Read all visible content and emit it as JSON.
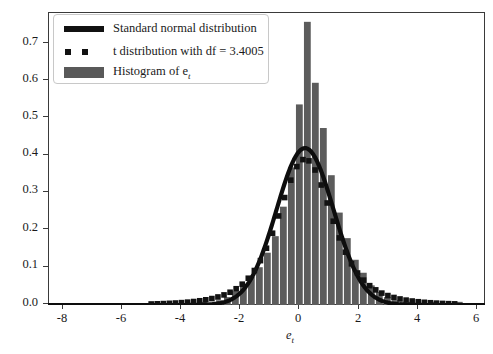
{
  "figure": {
    "background_color": "#ffffff",
    "frame_color": "#3a3a3a"
  },
  "legend": {
    "position": "upper-left",
    "entries": [
      {
        "label": "Standard normal distribution",
        "marker": "line",
        "color": "#111111"
      },
      {
        "label": "t distribution with df = 3.4005",
        "marker": "squares",
        "color": "#111111"
      },
      {
        "label": "Histogram of e",
        "label_sub": "t",
        "marker": "patch",
        "color": "#595959"
      }
    ]
  },
  "axes": {
    "xlabel": "e",
    "xlabel_sub": "t",
    "ylabel": "",
    "xticks": [
      "-8",
      "-6",
      "-4",
      "-2",
      "0",
      "2",
      "4",
      "6"
    ],
    "yticks": [
      "0.0",
      "0.1",
      "0.2",
      "0.3",
      "0.4",
      "0.5",
      "0.6",
      "0.7"
    ]
  },
  "chart_data": {
    "type": "bar",
    "title": "",
    "xlabel": "e_t",
    "ylabel": "density",
    "xlim": [
      -9.0,
      6.3
    ],
    "ylim": [
      0.0,
      0.745
    ],
    "grid": false,
    "legend_position": "upper left",
    "series": [
      {
        "name": "Histogram of e_t",
        "type": "bar",
        "color": "#5c5c5c",
        "bin_width": 0.28,
        "bin_centers": [
          -8.6,
          -8.32,
          -8.04,
          -7.76,
          -7.48,
          -7.2,
          -6.92,
          -6.64,
          -6.36,
          -6.08,
          -5.8,
          -5.52,
          -5.24,
          -4.96,
          -4.68,
          -4.4,
          -4.12,
          -3.84,
          -3.56,
          -3.28,
          -3.0,
          -2.72,
          -2.44,
          -2.16,
          -1.88,
          -1.6,
          -1.32,
          -1.04,
          -0.76,
          -0.48,
          -0.2,
          0.08,
          0.36,
          0.64,
          0.92,
          1.2,
          1.48,
          1.76,
          2.04,
          2.32,
          2.6,
          2.88,
          3.16,
          3.44,
          3.72,
          4.0,
          4.28,
          4.56,
          4.84,
          5.12,
          5.4
        ],
        "values": [
          0.004,
          0.0,
          0.0,
          0.0,
          0.0,
          0.0,
          0.0,
          0.0,
          0.004,
          0.0,
          0.0,
          0.004,
          0.0,
          0.0,
          0.004,
          0.0,
          0.004,
          0.0,
          0.008,
          0.004,
          0.012,
          0.02,
          0.035,
          0.05,
          0.072,
          0.096,
          0.133,
          0.175,
          0.25,
          0.35,
          0.51,
          0.72,
          0.565,
          0.45,
          0.33,
          0.235,
          0.17,
          0.115,
          0.082,
          0.05,
          0.033,
          0.02,
          0.012,
          0.008,
          0.008,
          0.004,
          0.004,
          0.008,
          0.004,
          0.004,
          0.008
        ]
      },
      {
        "name": "Standard normal distribution",
        "type": "line",
        "color": "#0d0d0d",
        "mean": 0.0,
        "sd": 1.0,
        "peak": 0.3989
      },
      {
        "name": "t distribution with df = 3.4005",
        "type": "scatter",
        "color": "#121212",
        "df": 3.4005,
        "peak": 0.3735
      }
    ]
  }
}
